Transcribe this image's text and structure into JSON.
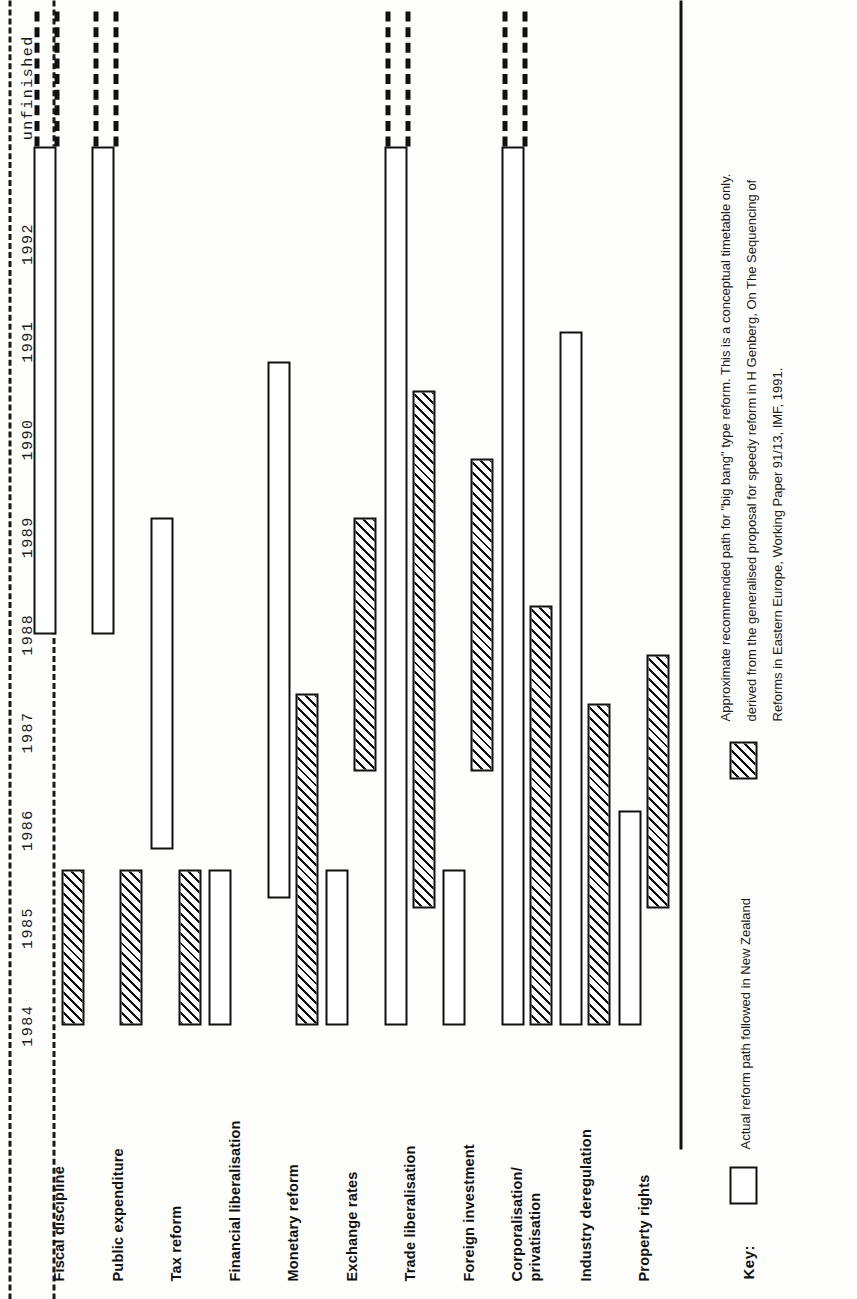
{
  "figure": {
    "orientation": "rotated-90-ccw",
    "ink_color": "#111111",
    "paper_color": "#fdfdfc"
  },
  "chart_data": {
    "type": "bar",
    "subtype": "gantt-timeline",
    "title": "",
    "xlabel": "",
    "ylabel": "",
    "grid": false,
    "legend_position": "bottom",
    "x_tick_labels": [
      "1984",
      "1985",
      "1986",
      "1987",
      "1988",
      "1989",
      "1990",
      "1991",
      "1992",
      "unfinished"
    ],
    "x_tick_values": [
      1984,
      1985,
      1986,
      1987,
      1988,
      1989,
      1990,
      1991,
      1992,
      1993.6
    ],
    "xlim": [
      1983.5,
      1994.4
    ],
    "categories": [
      "Fiscal discipline",
      "Public expenditure",
      "Tax reform",
      "Financial liberalisation",
      "Monetary reform",
      "Exchange rates",
      "Trade liberalisation",
      "Foreign investment",
      "Corporalisation/ privatisation",
      "Industry deregulation",
      "Property rights"
    ],
    "series": [
      {
        "name": "Actual reform path followed in New Zealand",
        "style": "hatched",
        "bars": [
          {
            "category": "Fiscal discipline",
            "start": 1984.0,
            "end": 1985.6,
            "open_ended": false
          },
          {
            "category": "Public expenditure",
            "start": 1984.0,
            "end": 1985.6,
            "open_ended": false
          },
          {
            "category": "Tax reform",
            "start": 1984.0,
            "end": 1985.6,
            "open_ended": false
          },
          {
            "category": "Monetary reform",
            "start": 1984.0,
            "end": 1987.4,
            "open_ended": false
          },
          {
            "category": "Exchange rates",
            "start": 1986.6,
            "end": 1989.2,
            "open_ended": false
          },
          {
            "category": "Trade liberalisation",
            "start": 1985.2,
            "end": 1990.5,
            "open_ended": false
          },
          {
            "category": "Foreign investment",
            "start": 1986.6,
            "end": 1989.8,
            "open_ended": false
          },
          {
            "category": "Corporalisation/ privatisation",
            "start": 1984.0,
            "end": 1988.3,
            "open_ended": false
          },
          {
            "category": "Industry deregulation",
            "start": 1984.0,
            "end": 1987.3,
            "open_ended": false
          },
          {
            "category": "Property rights",
            "start": 1985.2,
            "end": 1987.8,
            "open_ended": false
          }
        ]
      },
      {
        "name": "Approximate recommended path for \"big bang\" type reform",
        "style": "open",
        "bars": [
          {
            "category": "Fiscal discipline",
            "start": 1988.0,
            "end": 1993.0,
            "open_ended": true
          },
          {
            "category": "Public expenditure",
            "start": 1988.0,
            "end": 1993.0,
            "open_ended": true
          },
          {
            "category": "Tax reform",
            "start": 1985.8,
            "end": 1989.2,
            "open_ended": false
          },
          {
            "category": "Financial liberalisation",
            "start": 1984.0,
            "end": 1985.6,
            "open_ended": false
          },
          {
            "category": "Monetary reform",
            "start": 1985.3,
            "end": 1990.8,
            "open_ended": false
          },
          {
            "category": "Exchange rates",
            "start": 1984.0,
            "end": 1985.6,
            "open_ended": false
          },
          {
            "category": "Trade liberalisation",
            "start": 1984.0,
            "end": 1993.0,
            "open_ended": true
          },
          {
            "category": "Foreign investment",
            "start": 1984.0,
            "end": 1985.6,
            "open_ended": false
          },
          {
            "category": "Corporalisation/ privatisation",
            "start": 1984.0,
            "end": 1993.0,
            "open_ended": true
          },
          {
            "category": "Industry deregulation",
            "start": 1984.0,
            "end": 1991.1,
            "open_ended": false
          },
          {
            "category": "Property rights",
            "start": 1984.0,
            "end": 1986.2,
            "open_ended": false
          }
        ]
      }
    ]
  },
  "key": {
    "label": "Key:",
    "open_swatch_text": "Actual reform path followed in New Zealand",
    "hatch_swatch_lines": [
      "Approximate recommended path for \"big bang\" type reform. This is a conceptual timetable only.",
      "derived from the generalised proposal for speedy reform in H Genberg, On The Sequencing of",
      "Reforms in Eastern Europe, Working Paper 91/13, IMF,  1991."
    ]
  }
}
